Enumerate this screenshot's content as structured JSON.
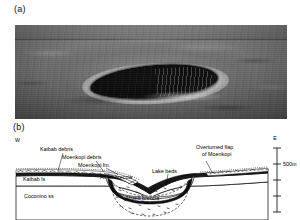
{
  "figure": {
    "panel_a": {
      "label": "(a)",
      "content": "aerial photograph of impact crater"
    },
    "panel_b": {
      "label": "(b)",
      "direction_west": "W",
      "direction_east": "E",
      "scale_label": "500m",
      "annotations": {
        "kaibab_debris": "Kaibab debris",
        "moenkopi_debris": "Moenkopi debris",
        "moenkopi_fm": "Moenkopi fm.",
        "kaibab_ls": "Kaibab ls",
        "airfall_breccia": "Airfall breccia",
        "lake_beds": "Lake beds",
        "overturned_flap_line1": "Overturned flap",
        "overturned_flap_line2": "of Moenkopi",
        "coconino_ss": "Coconino ss",
        "mixed_breccia": "Mixed breccia"
      }
    }
  },
  "colors": {
    "ink": "#000000",
    "paper": "#ffffff",
    "photo_dark": "#0c0c0c",
    "photo_mid": "#6e6e6e"
  }
}
